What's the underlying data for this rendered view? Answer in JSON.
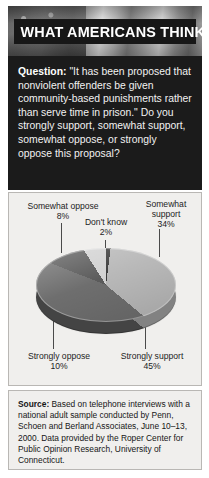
{
  "header": {
    "title": "WHAT AMERICANS THINK",
    "background_icon": "us-flag-photo"
  },
  "question": {
    "label": "Question:",
    "text": "\"It has been proposed that nonviolent offenders be given community-based punishments rather than serve time in prison.\" Do you strongly support, somewhat support, somewhat oppose, or strongly oppose this proposal?"
  },
  "chart_data": {
    "type": "pie",
    "title": "",
    "categories": [
      "Don't know",
      "Somewhat support",
      "Strongly support",
      "Strongly oppose",
      "Somewhat oppose"
    ],
    "values": [
      2,
      34,
      45,
      10,
      8
    ],
    "value_suffix": "%",
    "legend": "callout-labels",
    "three_d": true,
    "colors": [
      "#3a3a3a",
      "#b8b8b8",
      "#6e6e6e",
      "#5a5a5a",
      "#d2d2d2"
    ]
  },
  "labels": {
    "somewhat_oppose": {
      "name": "Somewhat oppose",
      "value": "8%"
    },
    "dont_know": {
      "name": "Don't know",
      "value": "2%"
    },
    "somewhat_support_line1": "Somewhat",
    "somewhat_support_line2": "support",
    "somewhat_support_value": "34%",
    "strongly_oppose": {
      "name": "Strongly oppose",
      "value": "10%"
    },
    "strongly_support": {
      "name": "Strongly support",
      "value": "45%"
    }
  },
  "source": {
    "label": "Source:",
    "text": "Based on telephone interviews with a national adult sample conducted by Penn, Schoen and Berland Associates, June 10–13, 2000. Data provided by the Roper Center for Public Opinion Research, University of Connecticut."
  }
}
